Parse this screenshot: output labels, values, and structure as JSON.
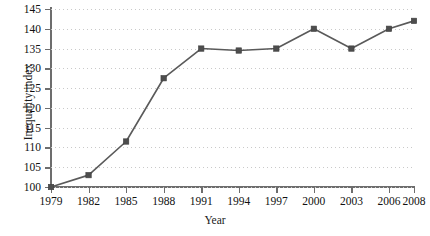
{
  "chart_data": {
    "type": "line",
    "title": "",
    "xlabel": "Year",
    "ylabel": "Inequality index",
    "categories": [
      "1979",
      "1982",
      "1985",
      "1988",
      "1991",
      "1994",
      "1997",
      "2000",
      "2003",
      "2006",
      "2008"
    ],
    "x": [
      1979,
      1982,
      1985,
      1988,
      1991,
      1994,
      1997,
      2000,
      2003,
      2006,
      2008
    ],
    "values": [
      100,
      103,
      111.5,
      127.5,
      135,
      134.5,
      135,
      140,
      135,
      140,
      142
    ],
    "series": [
      {
        "name": "Inequality index",
        "values": [
          100,
          103,
          111.5,
          127.5,
          135,
          134.5,
          135,
          140,
          135,
          140,
          142
        ]
      }
    ],
    "xlim": [
      1979,
      2008
    ],
    "ylim": [
      100,
      145
    ],
    "ytick_labels": [
      "100",
      "105",
      "110",
      "115",
      "120",
      "125",
      "130",
      "135",
      "140",
      "145"
    ],
    "ytick_values": [
      100,
      105,
      110,
      115,
      120,
      125,
      130,
      135,
      140,
      145
    ],
    "xtick_labels": [
      "1979",
      "1982",
      "1985",
      "1988",
      "1991",
      "1994",
      "1997",
      "2000",
      "2003",
      "2006",
      "2008"
    ],
    "grid": true,
    "grid_style": "dotted-horizontal",
    "legend": "none",
    "marker": "square",
    "line_color": "#5a5a5a",
    "marker_color": "#4d4d4d",
    "grid_color": "#c9c9c9",
    "axis_color": "#6d6d6d",
    "background": "#ffffff"
  }
}
